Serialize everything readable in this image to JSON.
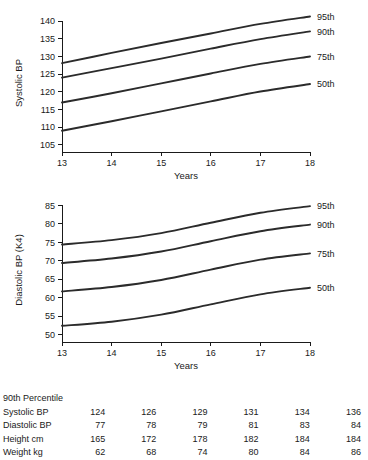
{
  "chart_data": [
    {
      "id": "systolic",
      "type": "line",
      "title": "",
      "xlabel": "Years",
      "ylabel": "Systolic BP",
      "x": [
        13,
        14,
        15,
        16,
        17,
        18
      ],
      "xlim": [
        13,
        18
      ],
      "ylim": [
        103,
        142
      ],
      "xticks": [
        13,
        14,
        15,
        16,
        17,
        18
      ],
      "xtick_labels": [
        "13",
        "14",
        "15",
        "16",
        "17",
        "18"
      ],
      "yticks": [
        105,
        110,
        115,
        120,
        125,
        130,
        135,
        140
      ],
      "ytick_labels": [
        "105",
        "110",
        "115",
        "120",
        "125",
        "130",
        "135",
        "140"
      ],
      "grid": false,
      "legend_position": "right-of-line-end",
      "series": [
        {
          "name": "95th",
          "label": "95th",
          "values": [
            128.1,
            131.0,
            133.8,
            136.5,
            139.2,
            141.3
          ]
        },
        {
          "name": "90th",
          "label": "90th",
          "values": [
            124.0,
            126.7,
            129.4,
            132.2,
            134.9,
            137.1
          ]
        },
        {
          "name": "75th",
          "label": "75th",
          "values": [
            117.0,
            119.6,
            122.4,
            125.2,
            127.9,
            130.0
          ]
        },
        {
          "name": "50th",
          "label": "50th",
          "values": [
            109.0,
            111.7,
            114.5,
            117.3,
            120.1,
            122.2
          ]
        }
      ]
    },
    {
      "id": "diastolic",
      "type": "line",
      "title": "",
      "xlabel": "Years",
      "ylabel": "Diastolic BP (K4)",
      "x": [
        13,
        14,
        15,
        16,
        17,
        18
      ],
      "xlim": [
        13,
        18
      ],
      "ylim": [
        48,
        87
      ],
      "xticks": [
        13,
        14,
        15,
        16,
        17,
        18
      ],
      "xtick_labels": [
        "13",
        "14",
        "15",
        "16",
        "17",
        "18"
      ],
      "yticks": [
        50,
        55,
        60,
        65,
        70,
        75,
        80,
        85
      ],
      "ytick_labels": [
        "50",
        "55",
        "60",
        "65",
        "70",
        "75",
        "80",
        "85"
      ],
      "grid": false,
      "legend_position": "right-of-line-end",
      "series": [
        {
          "name": "95th",
          "label": "95th",
          "values": [
            74.4,
            75.6,
            77.5,
            80.3,
            83.0,
            84.8
          ]
        },
        {
          "name": "90th",
          "label": "90th",
          "values": [
            69.4,
            70.6,
            72.5,
            75.3,
            78.0,
            79.8
          ]
        },
        {
          "name": "75th",
          "label": "75th",
          "values": [
            61.7,
            62.9,
            64.8,
            67.6,
            70.3,
            72.0
          ]
        },
        {
          "name": "50th",
          "label": "50th",
          "values": [
            52.4,
            53.5,
            55.4,
            58.2,
            60.9,
            62.7
          ]
        }
      ]
    }
  ],
  "table": {
    "title": "90th Percentile",
    "rows": [
      {
        "label": "Systolic BP",
        "values": [
          "124",
          "126",
          "129",
          "131",
          "134",
          "136"
        ]
      },
      {
        "label": "Diastolic BP",
        "values": [
          "77",
          "78",
          "79",
          "81",
          "83",
          "84"
        ]
      },
      {
        "label": "Height cm",
        "values": [
          "165",
          "172",
          "178",
          "182",
          "184",
          "184"
        ]
      },
      {
        "label": "Weight kg",
        "values": [
          "62",
          "68",
          "74",
          "80",
          "84",
          "86"
        ]
      }
    ]
  },
  "colors": {
    "curve": "#2b2b2b",
    "axis": "#1a1a1a",
    "text": "#1a1a1a",
    "background": "#ffffff"
  }
}
